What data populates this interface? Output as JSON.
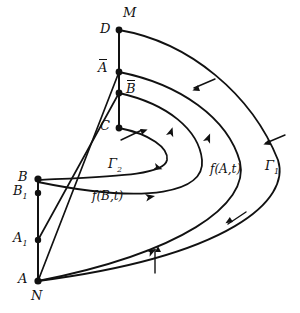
{
  "figure": {
    "kind": "phase-portrait-diagram",
    "background": "#ffffff",
    "stroke": "#111111",
    "width": 300,
    "height": 313
  },
  "points": {
    "M": {
      "label": "M",
      "x": 119,
      "y": 30,
      "label_x": 123,
      "label_y": 10
    },
    "D": {
      "label": "D",
      "x": 119,
      "y": 30,
      "label_x": 101,
      "label_y": 24
    },
    "Abar": {
      "label": "A",
      "overline": true,
      "x": 119,
      "y": 72,
      "label_x": 99,
      "label_y": 63
    },
    "Bbar": {
      "label": "B",
      "overline": true,
      "x": 119,
      "y": 93,
      "label_x": 126,
      "label_y": 84
    },
    "C": {
      "label": "C",
      "x": 119,
      "y": 128,
      "label_x": 101,
      "label_y": 121
    },
    "B": {
      "label": "B",
      "x": 38,
      "y": 179,
      "label_x": 19,
      "label_y": 172
    },
    "B1": {
      "label": "B",
      "sub": "1",
      "x": 38,
      "y": 193,
      "label_x": 14,
      "label_y": 187
    },
    "A1": {
      "label": "A",
      "sub": "1",
      "x": 38,
      "y": 240,
      "label_x": 14,
      "label_y": 234
    },
    "A": {
      "label": "A",
      "x": 38,
      "y": 281,
      "label_x": 19,
      "label_y": 274
    },
    "N": {
      "label": "N",
      "x": 38,
      "y": 281,
      "label_x": 32,
      "label_y": 292
    }
  },
  "curve_labels": [
    {
      "name": "gamma-1",
      "text": "Γ",
      "sub": "1",
      "x": 265,
      "y": 160
    },
    {
      "name": "gamma-2",
      "text": "Γ",
      "sub": "2",
      "x": 108,
      "y": 158
    },
    {
      "name": "f-A-t",
      "text": "f(A,t)",
      "x": 210,
      "y": 164
    },
    {
      "name": "f-B-t",
      "text": "f(B,t)",
      "x": 92,
      "y": 191
    }
  ],
  "segments": [
    {
      "name": "right-vertical-segment",
      "from": "M",
      "to": "C"
    },
    {
      "name": "left-vertical-segment",
      "from": "B",
      "to": "A"
    },
    {
      "name": "chord-Abar-to-A",
      "from": "Abar",
      "to": "A"
    },
    {
      "name": "chord-Bbar-to-A1",
      "from": "Bbar",
      "to": "A1"
    }
  ],
  "trajectories": [
    {
      "name": "gamma-1-outer",
      "from": "M",
      "to": "A",
      "ticks": 3
    },
    {
      "name": "f-A-t-trajectory",
      "from": "Abar",
      "to": "A",
      "ticks": 0
    },
    {
      "name": "f-B-t-trajectory",
      "from": "Bbar",
      "to": "B",
      "ticks": 0
    },
    {
      "name": "gamma-2-inner",
      "from": "C",
      "to": "B",
      "ticks": 0
    }
  ],
  "markers": {
    "arrowhead": "filled-triangle",
    "transversal": "short-tick-stroke"
  }
}
